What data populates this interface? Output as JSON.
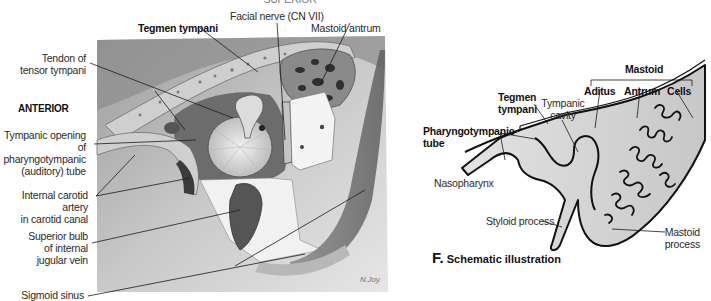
{
  "figure_left": {
    "top_cut_label": "SUPERIOR",
    "orientation_label": "ANTERIOR",
    "labels": {
      "tegmen_tympani": "Tegmen tympani",
      "facial_nerve": "Facial nerve (CN VII)",
      "mastoid_antrum": "Mastoid antrum",
      "tendon_line1": "Tendon of",
      "tendon_line2": "tensor tympani",
      "tympanic_opening_line1": "Tympanic opening of",
      "tympanic_opening_line2": "pharyngotympanic",
      "tympanic_opening_line3": "(auditory) tube",
      "carotid_line1": "Internal carotid artery",
      "carotid_line2": "in carotid canal",
      "bulb_line1": "Superior bulb",
      "bulb_line2": "of internal",
      "bulb_line3": "jugular vein",
      "sigmoid_sinus": "Sigmoid sinus"
    },
    "signature": "N.Joy."
  },
  "figure_right": {
    "letter": "F.",
    "title": "Schematic illustration",
    "labels": {
      "mastoid": "Mastoid",
      "aditus": "Aditus",
      "antrum": "Antrum",
      "cells": "Cells",
      "tegmen_line1": "Tegmen",
      "tegmen_line2": "tympani",
      "tympanic_cavity_line1": "Tympanic",
      "tympanic_cavity_line2": "cavity",
      "pharyngotympanic_line1": "Pharyngotympanic",
      "pharyngotympanic_line2": "tube",
      "nasopharynx": "Nasopharynx",
      "styloid_process": "Styloid process",
      "mastoid_process_line1": "Mastoid",
      "mastoid_process_line2": "process"
    }
  },
  "colors": {
    "background": "#ffffff",
    "illustration_gray": "#a9a9a9",
    "schematic_fill": "#d4d4d4",
    "outline": "#111111"
  }
}
